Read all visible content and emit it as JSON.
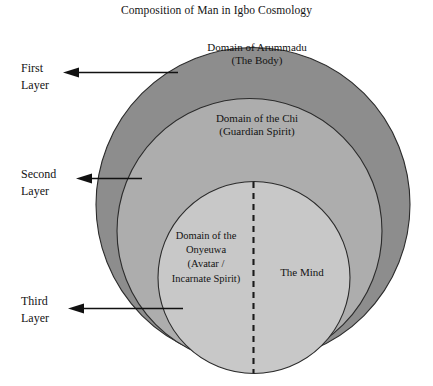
{
  "title": "Composition of Man in Igbo Cosmology",
  "diagram": {
    "type": "nested-circles",
    "layers": [
      {
        "id": "outer",
        "pointer_label": "First\nLayer",
        "pointer_label_line1": "First",
        "pointer_label_line2": "Layer",
        "region_label": "Domain of Arummadu\n(The Body)",
        "region_label_line1": "Domain of Arummadu",
        "region_label_line2": "(The Body)",
        "fill": "#8d8d8d"
      },
      {
        "id": "middle",
        "pointer_label": "Second\nLayer",
        "pointer_label_line1": "Second",
        "pointer_label_line2": "Layer",
        "region_label": "Domain of the Chi\n(Guardian Spirit)",
        "region_label_line1": "Domain of the Chi",
        "region_label_line2": "(Guardian Spirit)",
        "fill": "#adadad"
      },
      {
        "id": "inner",
        "pointer_label": "Third\nLayer",
        "pointer_label_line1": "Third",
        "pointer_label_line2": "Layer",
        "region_label": "Domain of the\nOnyeuwa\n(Avatar /\nIncarnate Spirit)",
        "region_label_left": "Domain of the\nOnyeuwa\n(Avatar /\nIncarnate Spirit)",
        "region_label_right": "The Mind",
        "fill": "#c8c8c8"
      }
    ],
    "divider": {
      "style": "dashed-vertical",
      "color": "#1a1a1a"
    },
    "stroke": "#2b2b2b",
    "background": "#ffffff"
  }
}
